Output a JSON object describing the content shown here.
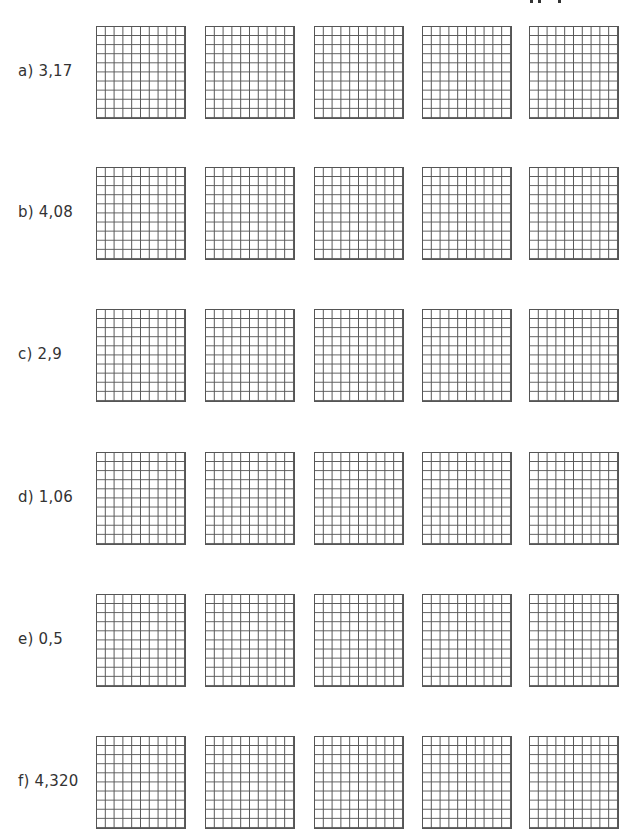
{
  "worksheet": {
    "grid_size": "10x10",
    "grids_per_row": 5,
    "exercises": [
      {
        "letter": "a)",
        "value": "3,17",
        "label": "a) 3,17"
      },
      {
        "letter": "b)",
        "value": "4,08",
        "label": "b) 4,08"
      },
      {
        "letter": "c)",
        "value": "2,9",
        "label": "c) 2,9"
      },
      {
        "letter": "d)",
        "value": "1,06",
        "label": "d) 1,06"
      },
      {
        "letter": "e)",
        "value": "0,5",
        "label": "e) 0,5"
      },
      {
        "letter": "f)",
        "value": "4,320",
        "label": "f) 4,320"
      }
    ]
  },
  "colors": {
    "grid_line": "#555555",
    "text": "#333333",
    "background": "#ffffff"
  }
}
